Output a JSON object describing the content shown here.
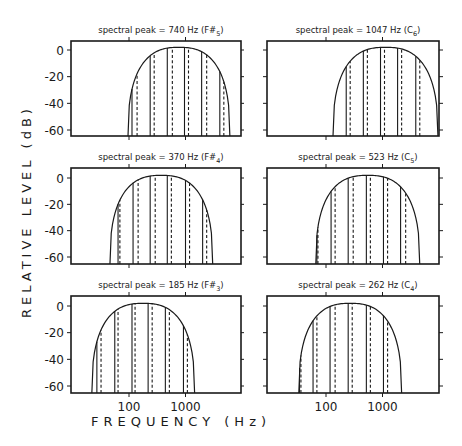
{
  "figure": {
    "ylabel": "RELATIVE LEVEL (dB)",
    "xlabel": "FREQUENCY (Hz)",
    "colors": {
      "ink": "#1a1a1a",
      "background": "#ffffff"
    }
  },
  "chart_data": {
    "type": "line",
    "title": "",
    "xlabel": "FREQUENCY (Hz)",
    "ylabel": "RELATIVE LEVEL (dB)",
    "xscale": "log",
    "xlim": [
      20,
      12000
    ],
    "ylim": [
      -65,
      7
    ],
    "yticks": [
      0,
      -20,
      -40,
      -60
    ],
    "xticks": [
      100,
      1000
    ],
    "xtick_labels": [
      "100",
      "1000"
    ],
    "grid": false,
    "layout": "3 rows x 2 columns",
    "legend": "solid vertical lines and dashed vertical lines mark spectral components under a dome-shaped envelope",
    "panels": [
      {
        "id": "p740",
        "row": 0,
        "col": 0,
        "title": "spectral peak = 740 Hz (F#5)",
        "title_main": "spectral peak = 740 Hz (F#",
        "title_sub": "5",
        "title_end": ")",
        "spectral_peak_hz": 740,
        "envelope_hz": [
          96,
          6100
        ],
        "envelope_peak_db": 2,
        "solid_lines_hz": [
          113,
          237,
          476,
          960,
          1930,
          4050
        ],
        "dashed_lines_hz": [
          139,
          279,
          585,
          1130,
          2370,
          4770
        ]
      },
      {
        "id": "p1047",
        "row": 0,
        "col": 1,
        "title": "spectral peak = 1047 Hz (C6)",
        "title_main": "spectral peak = 1047 Hz (C",
        "title_sub": "6",
        "title_end": ")",
        "spectral_peak_hz": 1047,
        "envelope_hz": [
          133,
          9580
        ],
        "envelope_peak_db": 2,
        "solid_lines_hz": [
          128,
          228,
          458,
          922,
          1850,
          3880
        ],
        "dashed_lines_hz": [
          133,
          268,
          540,
          1085,
          2180,
          4570
        ]
      },
      {
        "id": "p370",
        "row": 1,
        "col": 0,
        "title": "spectral peak = 370 Hz (F#4)",
        "title_main": "spectral peak = 370 Hz (F#",
        "title_sub": "4",
        "title_end": ")",
        "spectral_peak_hz": 370,
        "envelope_hz": [
          46,
          3030
        ],
        "envelope_peak_db": 2,
        "solid_lines_hz": [
          64,
          118,
          237,
          476,
          1000,
          2010
        ],
        "dashed_lines_hz": [
          69,
          145,
          291,
          562,
          1180,
          2370
        ]
      },
      {
        "id": "p523",
        "row": 1,
        "col": 1,
        "title": "spectral peak = 523 Hz (C5)",
        "title_main": "spectral peak = 523 Hz (C",
        "title_sub": "5",
        "title_end": ")",
        "spectral_peak_hz": 523,
        "envelope_hz": [
          66,
          4560
        ],
        "envelope_peak_db": 2,
        "solid_lines_hz": [
          69,
          123,
          247,
          518,
          1040,
          2090
        ],
        "dashed_lines_hz": [
          72,
          145,
          303,
          610,
          1230,
          2570
        ]
      },
      {
        "id": "p185",
        "row": 2,
        "col": 0,
        "title": "spectral peak = 185 Hz (F#3)",
        "title_main": "spectral peak = 185 Hz (F#",
        "title_sub": "3",
        "title_end": ")",
        "spectral_peak_hz": 185,
        "envelope_hz": [
          22,
          1450
        ],
        "envelope_peak_db": 2,
        "solid_lines_hz": [
          27,
          56,
          113,
          218,
          440,
          920
        ],
        "dashed_lines_hz": [
          32,
          64,
          128,
          257,
          518,
          1080
        ]
      },
      {
        "id": "p262",
        "row": 2,
        "col": 1,
        "title": "spectral peak = 262 Hz (C4)",
        "title_main": "spectral peak = 262 Hz (C",
        "title_sub": "4",
        "title_end": ")",
        "spectral_peak_hz": 262,
        "envelope_hz": [
          33,
          2180
        ],
        "envelope_peak_db": 2,
        "solid_lines_hz": [
          34,
          59,
          118,
          247,
          518,
          1040
        ],
        "dashed_lines_hz": [
          36,
          69,
          145,
          291,
          610,
          1230
        ]
      }
    ]
  }
}
